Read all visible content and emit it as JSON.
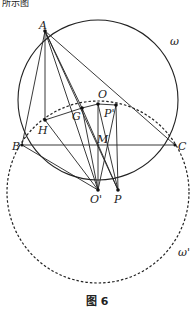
{
  "header": {
    "partial_text": "所示图"
  },
  "figure": {
    "caption": "图 6",
    "circles": {
      "omega": {
        "label": "ω",
        "style": "solid"
      },
      "omega_prime": {
        "label": "ω'",
        "style": "dashed"
      }
    },
    "points": {
      "A": "A",
      "B": "B",
      "C": "C",
      "H": "H",
      "G": "G",
      "O": "O",
      "P_prime": "P'",
      "M": "M",
      "O_prime": "O'",
      "P": "P"
    }
  }
}
